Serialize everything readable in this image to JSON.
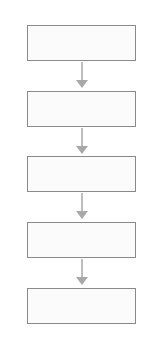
{
  "diagram": {
    "type": "vertical-flowchart",
    "colors": {
      "box_border": "#8a8a8a",
      "box_fill": "#fbfbfb",
      "arrow": "#a8a8a8"
    },
    "nodes": [
      {
        "id": "box-1",
        "label": ""
      },
      {
        "id": "box-2",
        "label": ""
      },
      {
        "id": "box-3",
        "label": ""
      },
      {
        "id": "box-4",
        "label": ""
      },
      {
        "id": "box-5",
        "label": ""
      }
    ],
    "edges": [
      {
        "from": "box-1",
        "to": "box-2"
      },
      {
        "from": "box-2",
        "to": "box-3"
      },
      {
        "from": "box-3",
        "to": "box-4"
      },
      {
        "from": "box-4",
        "to": "box-5"
      }
    ]
  }
}
